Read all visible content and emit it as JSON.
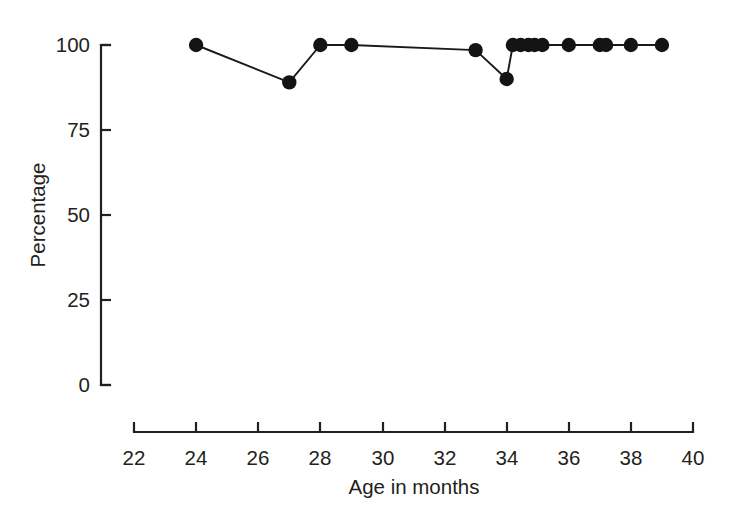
{
  "chart_data": {
    "type": "line",
    "title": "",
    "xlabel": "Age in months",
    "ylabel": "Percentage",
    "xlim": [
      22,
      40
    ],
    "ylim": [
      0,
      100
    ],
    "xticks": [
      22,
      24,
      26,
      28,
      30,
      32,
      34,
      36,
      38,
      40
    ],
    "xtick_labels": [
      "22",
      "24",
      "26",
      "28",
      "30",
      "32",
      "34",
      "36",
      "38",
      "40"
    ],
    "yticks": [
      0,
      25,
      50,
      75,
      100
    ],
    "ytick_labels": [
      "0",
      "25",
      "50",
      "75",
      "100"
    ],
    "grid": false,
    "legend": false,
    "marker": "filled-circle",
    "marker_color": "#141414",
    "line_color": "#1a1a1a",
    "axis_color": "#231f20",
    "series": [
      {
        "name": "Percentage",
        "x": [
          24,
          27,
          28,
          29,
          33,
          34,
          34.2,
          34.45,
          34.7,
          34.9,
          35.15,
          36,
          37,
          37.2,
          38,
          39
        ],
        "y": [
          100,
          89,
          100,
          100,
          98.5,
          90,
          100,
          100,
          100,
          100,
          100,
          100,
          100,
          100,
          100,
          100
        ]
      }
    ]
  },
  "axes": {
    "y_label": "Percentage",
    "x_label": "Age in months"
  }
}
